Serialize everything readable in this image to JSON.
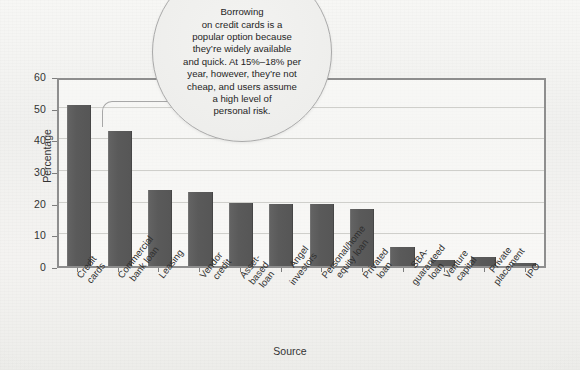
{
  "chart_data": {
    "type": "bar",
    "title": "",
    "xlabel": "Source",
    "ylabel": "Percentage",
    "ylim": [
      0,
      60
    ],
    "yticks": [
      0,
      10,
      20,
      30,
      40,
      50,
      60
    ],
    "grid": true,
    "legend": "none",
    "bar_color": "#585858",
    "categories": [
      "Credit cards",
      "Commercial\nbank loan",
      "Leasing",
      "Vendor credit",
      "Asset-\nbased loan",
      "Angel investors",
      "Personal/home\nequity loan",
      "Privated\nloan",
      "SBA-guaranteed\nloan",
      "Venture capital",
      "Private\nplacement",
      "IPO"
    ],
    "values": [
      51,
      42.5,
      24,
      23.5,
      20,
      19.5,
      19.5,
      18,
      6,
      2,
      3,
      1
    ],
    "annotations": [
      {
        "type": "callout",
        "target_category": "Credit cards",
        "text": "Borrowing on credit cards is a popular option because they’re widely available and quick. At 15%–18% per year, however, they’re not cheap, and users assume a high level of personal risk."
      }
    ]
  },
  "callout": {
    "lines": [
      "Borrowing",
      "on credit cards is a",
      "popular option because",
      "they’re widely available",
      "and quick. At 15%–18% per",
      "year, however, they’re not",
      "cheap, and users assume",
      "a high level of",
      "personal risk."
    ]
  },
  "caption": ""
}
